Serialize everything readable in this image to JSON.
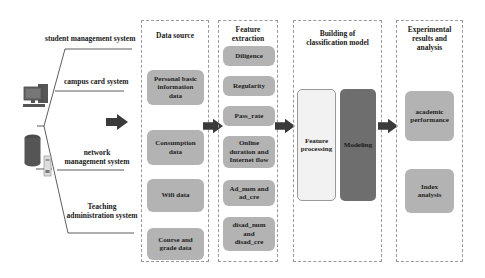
{
  "systems": [
    {
      "label": "student management system"
    },
    {
      "label": "campus card system"
    },
    {
      "label": "network\nmanagement system",
      "line1": "network",
      "line2": "management system"
    },
    {
      "label": "Teaching\nadministration system",
      "line1": "Teaching",
      "line2": "administration system"
    }
  ],
  "icons": {
    "computer": "desktop-computer-icon",
    "server": "server-database-icon",
    "arrow": "right-arrow-icon"
  },
  "panels": {
    "data_source": {
      "title": "Data source",
      "items": [
        {
          "line1": "Personal basic",
          "line2": "information",
          "line3": "data"
        },
        {
          "line1": "Consumption",
          "line2": "data"
        },
        {
          "line1": "Wifi data"
        },
        {
          "line1": "Course and",
          "line2": "grade data"
        }
      ]
    },
    "feature_extraction": {
      "title_line1": "Feature",
      "title_line2": "extraction",
      "items": [
        {
          "line1": "Diligence"
        },
        {
          "line1": "Regularity"
        },
        {
          "line1": "Pass_rate"
        },
        {
          "line1": "Online",
          "line2": "duration and",
          "line3": "Internet flow"
        },
        {
          "line1": "Ad_num and",
          "line2": "ad_cre"
        },
        {
          "line1": "disad_num",
          "line2": "and",
          "line3": "disad_cre"
        }
      ]
    },
    "classification_model": {
      "title_line1": "Building of",
      "title_line2": "classification model",
      "items": [
        {
          "line1": "Feature",
          "line2": "processing"
        },
        {
          "line1": "Modeling"
        }
      ]
    },
    "results": {
      "title_line1": "Experimental",
      "title_line2": "results and",
      "title_line3": "analysis",
      "items": [
        {
          "line1": "academic",
          "line2": "performance"
        },
        {
          "line1": "Index",
          "line2": "analysis"
        }
      ]
    }
  },
  "colors": {
    "pill": "#b3b3b3",
    "modeling": "#6e6e6e",
    "feature_processing": "#f2f2f2",
    "arrow": "#3a3a3a",
    "panel_border": "#9a9a9a"
  }
}
